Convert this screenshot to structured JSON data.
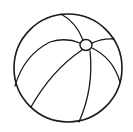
{
  "image": {
    "subject": "beach ball line drawing",
    "icon": "beach-ball-icon",
    "colors": {
      "background": "#ffffff",
      "stroke": "#1a1a1a"
    }
  }
}
